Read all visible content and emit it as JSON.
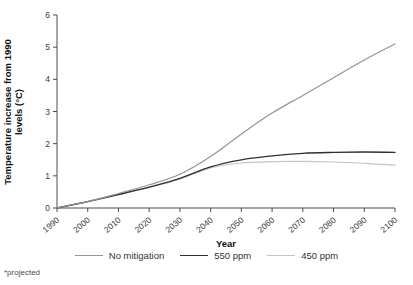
{
  "figure": {
    "footnote": "*projected",
    "background_color": "#ffffff"
  },
  "chart_data": {
    "type": "line",
    "title": "",
    "xlabel": "Year",
    "ylabel": "Temperature increase from 1990 levels (°C)",
    "ylabel_lines": [
      "Temperature increase from 1990",
      "levels (°C)"
    ],
    "xlim": [
      1990,
      2100
    ],
    "ylim": [
      0,
      6
    ],
    "x": [
      1990,
      2000,
      2010,
      2020,
      2030,
      2040,
      2050,
      2060,
      2070,
      2080,
      2090,
      2100
    ],
    "x_tick_labels": [
      "1990",
      "2000",
      "2010",
      "2020",
      "2030",
      "2040",
      "2050",
      "2060",
      "2070",
      "2080",
      "2090",
      "2100"
    ],
    "y_ticks": [
      0,
      1,
      2,
      3,
      4,
      5,
      6
    ],
    "grid": false,
    "legend_position": "bottom",
    "axis_color": "#4d4d4d",
    "tick_label_color": "#3a3a3a",
    "series": [
      {
        "name": "No mitigation",
        "color": "#949494",
        "values": [
          0,
          0.2,
          0.45,
          0.72,
          1.05,
          1.6,
          2.3,
          2.95,
          3.5,
          4.05,
          4.6,
          5.1
        ]
      },
      {
        "name": "550 ppm",
        "color": "#2f2f2f",
        "values": [
          0,
          0.2,
          0.42,
          0.65,
          0.92,
          1.28,
          1.5,
          1.62,
          1.7,
          1.73,
          1.74,
          1.73
        ]
      },
      {
        "name": "450 ppm",
        "color": "#c5c5c5",
        "values": [
          0,
          0.2,
          0.42,
          0.64,
          0.9,
          1.25,
          1.4,
          1.44,
          1.45,
          1.43,
          1.39,
          1.33
        ]
      }
    ]
  }
}
